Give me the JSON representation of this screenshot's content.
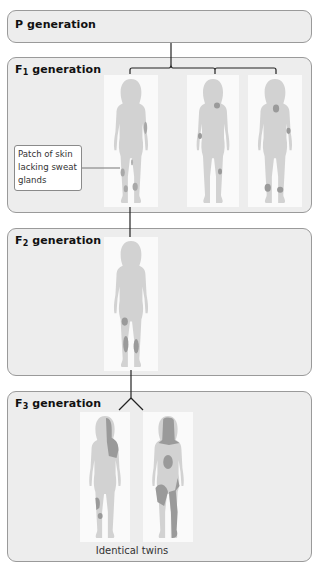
{
  "panels": {
    "p": {
      "title": "P generation"
    },
    "f1": {
      "title_prefix": "F",
      "title_sub": "1",
      "title_suffix": " generation"
    },
    "f2": {
      "title_prefix": "F",
      "title_sub": "2",
      "title_suffix": " generation"
    },
    "f3": {
      "title_prefix": "F",
      "title_sub": "3",
      "title_suffix": " generation"
    }
  },
  "callout": {
    "text": "Patch of skin lacking sweat glands"
  },
  "caption": {
    "text": "Identical twins"
  },
  "colors": {
    "panel_bg": "#ededed",
    "panel_border": "#9a9a9a",
    "silhouette": "#d2d2d2",
    "patch": "#9a9a9a",
    "connector": "#222222"
  },
  "figures": [
    {
      "generation": "F1",
      "index": 1,
      "patches": [
        "left-lower-leg",
        "right-knee",
        "forearm"
      ]
    },
    {
      "generation": "F1",
      "index": 2,
      "patches": [
        "upper-chest",
        "left-hip",
        "right-knee"
      ]
    },
    {
      "generation": "F1",
      "index": 3,
      "patches": [
        "upper-chest",
        "right-elbow",
        "both-shins"
      ]
    },
    {
      "generation": "F2",
      "index": 1,
      "patches": [
        "left-thigh",
        "both-shins"
      ]
    },
    {
      "generation": "F3",
      "index": 1,
      "patches": [
        "face-and-shoulder",
        "left-thigh"
      ]
    },
    {
      "generation": "F3",
      "index": 2,
      "patches": [
        "face",
        "torso",
        "hip",
        "left-leg"
      ]
    }
  ]
}
